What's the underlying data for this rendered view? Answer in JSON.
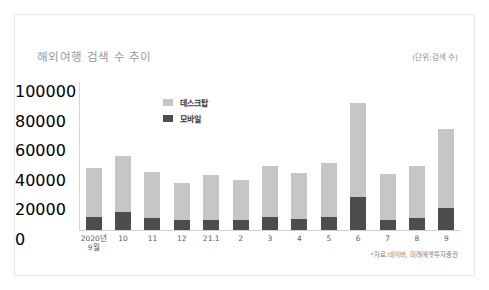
{
  "card": {
    "title": "해외여행 검색 수 추이",
    "unit_label": "(단위:검색 수)",
    "source_note": "*자료:네이버, 미래에셋투자증권"
  },
  "legend": {
    "items": [
      {
        "label": "데스크탑",
        "color": "#c6c6c6",
        "key": "desktop"
      },
      {
        "label": "모바일",
        "color": "#4d4d4d",
        "key": "mobile"
      }
    ]
  },
  "colors": {
    "desktop": "#c6c6c6",
    "mobile": "#4d4d4d",
    "axis": "#d0d0d0",
    "title": "#9a9a9a",
    "tick_text": "#5c5c5c",
    "card_border": "#e8e8e8",
    "background": "#ffffff"
  },
  "chart_data": {
    "type": "bar",
    "stacked": true,
    "title": "해외여행 검색 수 추이",
    "subtitle": "",
    "xlabel": "",
    "ylabel": "",
    "unit": "검색 수",
    "grid": false,
    "legend_position": "inside-top-left",
    "ylim": [
      0,
      100000
    ],
    "yticks": [
      0,
      20000,
      40000,
      60000,
      80000,
      100000
    ],
    "ytick_labels": [
      "0",
      "20000",
      "40000",
      "60000",
      "80000",
      "100000"
    ],
    "categories": [
      "2020년\n9월",
      "10",
      "11",
      "12",
      "21.1",
      "2",
      "3",
      "4",
      "5",
      "6",
      "7",
      "8",
      "9"
    ],
    "series": [
      {
        "name": "모바일",
        "color": "#4d4d4d",
        "values": [
          9000,
          12500,
          8000,
          6500,
          7000,
          6500,
          8500,
          7500,
          8500,
          22000,
          7000,
          8000,
          15000
        ]
      },
      {
        "name": "데스크탑",
        "color": "#c6c6c6",
        "values": [
          33000,
          37500,
          31000,
          25000,
          30000,
          27500,
          34500,
          31000,
          36500,
          64000,
          31000,
          35500,
          53000
        ]
      }
    ],
    "totals": [
      42000,
      50000,
      39000,
      31500,
      37000,
      34000,
      43000,
      38500,
      45000,
      86000,
      38000,
      43500,
      68000
    ],
    "annotations": [
      "*자료:네이버, 미래에셋투자증권"
    ]
  }
}
